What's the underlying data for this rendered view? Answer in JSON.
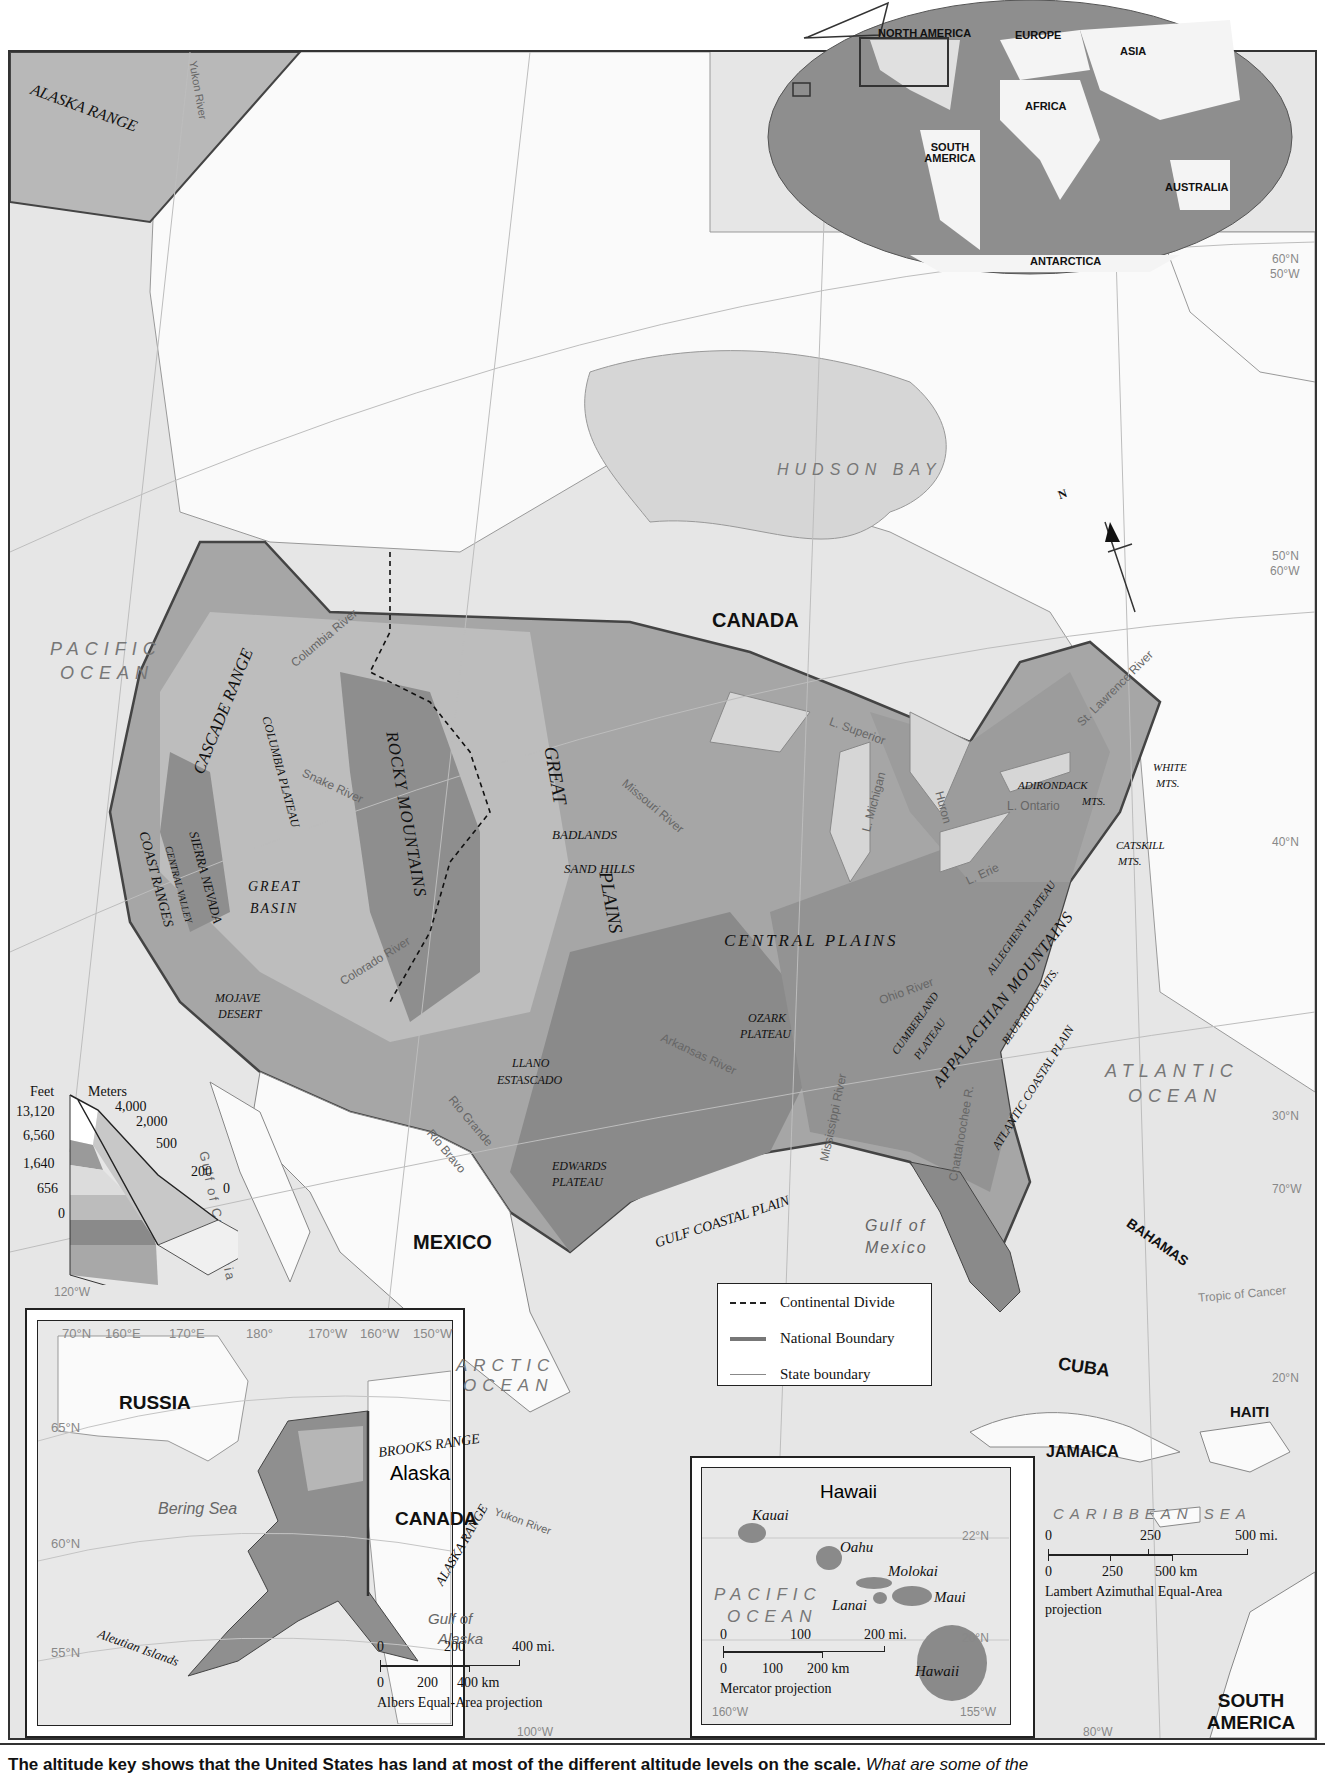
{
  "map": {
    "title_region": "United States physical map",
    "colors": {
      "background": "#e6e6e6",
      "land_white": "#fafafa",
      "lowland": "#888888",
      "highland": "#b5b5b5",
      "ocean_inset": "#8a8a8a"
    },
    "continents_inset": {
      "labels": [
        "NORTH AMERICA",
        "EUROPE",
        "ASIA",
        "AFRICA",
        "SOUTH AMERICA",
        "AUSTRALIA",
        "ANTARCTICA"
      ]
    },
    "countries": {
      "canada": "CANADA",
      "mexico": "MEXICO",
      "cuba": "CUBA",
      "haiti": "HAITI",
      "jamaica": "JAMAICA",
      "bahamas": "BAHAMAS",
      "south_america": "SOUTH AMERICA"
    },
    "water": {
      "pacific": [
        "PACIFIC",
        "OCEAN"
      ],
      "atlantic": [
        "ATLANTIC",
        "OCEAN"
      ],
      "hudson_bay": "HUDSON BAY",
      "gulf_mexico": [
        "Gulf of",
        "Mexico"
      ],
      "gulf_california": "Gulf of California",
      "caribbean": "CARIBBEAN SEA",
      "l_superior": "L. Superior",
      "l_michigan": "L. Michigan",
      "l_huron": "Huron",
      "l_erie": "L. Erie",
      "l_ontario": "L. Ontario"
    },
    "rivers": [
      "Yukon River",
      "Columbia River",
      "Snake River",
      "Colorado River",
      "Missouri River",
      "Arkansas River",
      "Mississippi River",
      "Ohio River",
      "Rio Grande",
      "Rio Bravo",
      "St. Lawrence River",
      "Chattahoochee R.",
      "Hudson R."
    ],
    "physical": {
      "alaska_range": "ALASKA RANGE",
      "cascade": "CASCADE RANGE",
      "columbia_plateau": "COLUMBIA PLATEAU",
      "rocky": "ROCKY MOUNTAINS",
      "great_plains": [
        "GREAT",
        "PLAINS"
      ],
      "badlands": "BADLANDS",
      "sand_hills": "SAND HILLS",
      "sierra": "SIERRA NEVADA",
      "central_valley": "CENTRAL VALLEY",
      "coast_ranges": "COAST RANGES",
      "great_basin": [
        "GREAT",
        "BASIN"
      ],
      "mojave": [
        "MOJAVE",
        "DESERT"
      ],
      "central_plains": "CENTRAL PLAINS",
      "ozark": [
        "OZARK",
        "PLATEAU"
      ],
      "llano": [
        "LLANO",
        "ESTASCADO"
      ],
      "edwards": [
        "EDWARDS",
        "PLATEAU"
      ],
      "gulf_coastal": "GULF COASTAL PLAIN",
      "cumberland": [
        "CUMBERLAND",
        "PLATEAU"
      ],
      "allegheny": "ALLEGHENY PLATEAU",
      "appalachian": "APPALACHIAN MOUNTAINS",
      "blue_ridge": "BLUE RIDGE MTS.",
      "atlantic_coastal": "ATLANTIC COASTAL PLAIN",
      "adirondack": [
        "ADIRONDACK",
        "MTS."
      ],
      "catskill": [
        "CATSKILL",
        "MTS."
      ],
      "white": [
        "WHITE",
        "MTS."
      ]
    },
    "gridlines": {
      "right": [
        "60°N",
        "50°W",
        "50°N",
        "60°W",
        "40°N",
        "30°N",
        "70°W",
        "20°N"
      ],
      "bottom": [
        "110°W",
        "100°W",
        "90°W",
        "80°W"
      ],
      "left": [
        "120°W"
      ],
      "tropic": "Tropic of Cancer"
    },
    "north_arrow": "N"
  },
  "elevation_key": {
    "feet_header": "Feet",
    "meters_header": "Meters",
    "feet": [
      "13,120",
      "6,560",
      "1,640",
      "656",
      "0"
    ],
    "meters": [
      "4,000",
      "2,000",
      "500",
      "200",
      "0"
    ]
  },
  "legend": {
    "items": [
      {
        "label": "Continental Divide",
        "style": "dashed"
      },
      {
        "label": "National Boundary",
        "style": "thick"
      },
      {
        "label": "State boundary",
        "style": "thin"
      }
    ]
  },
  "alaska_inset": {
    "title": "Alaska",
    "russia": "RUSSIA",
    "canada": "CANADA",
    "arctic": [
      "ARCTIC",
      "OCEAN"
    ],
    "bering": "Bering Sea",
    "gulf": [
      "Gulf of",
      "Alaska"
    ],
    "brooks": "BROOKS RANGE",
    "alaska_range": "ALASKA RANGE",
    "yukon": "Yukon River",
    "aleutian": "Aleutian Islands",
    "top_ticks": [
      "70°N",
      "160°E",
      "170°E",
      "180°",
      "170°W",
      "160°W",
      "150°W",
      "140°W",
      "130°W",
      "120°W"
    ],
    "left_ticks": [
      "65°N",
      "60°N",
      "55°N"
    ],
    "scale_mi": [
      "0",
      "200",
      "400 mi."
    ],
    "scale_km": [
      "0",
      "200",
      "400 km"
    ],
    "projection": "Albers Equal-Area projection"
  },
  "hawaii_inset": {
    "title": "Hawaii",
    "islands": [
      "Kauai",
      "Oahu",
      "Molokai",
      "Maui",
      "Lanai",
      "Hawaii"
    ],
    "ocean": [
      "PACIFIC",
      "OCEAN"
    ],
    "ticks": [
      "22°N",
      "20°N",
      "160°W",
      "155°W"
    ],
    "scale_mi": [
      "0",
      "100",
      "200 mi."
    ],
    "scale_km": [
      "0",
      "100",
      "200 km"
    ],
    "projection": "Mercator projection"
  },
  "main_scale": {
    "mi": [
      "0",
      "250",
      "500 mi."
    ],
    "km": [
      "0",
      "250",
      "500 km"
    ],
    "projection": [
      "Lambert Azimuthal Equal-Area",
      "projection"
    ]
  },
  "caption": {
    "bold": "The altitude key shows that the United States has land at most of the different altitude levels on the scale.",
    "italic": "What are some of the"
  }
}
